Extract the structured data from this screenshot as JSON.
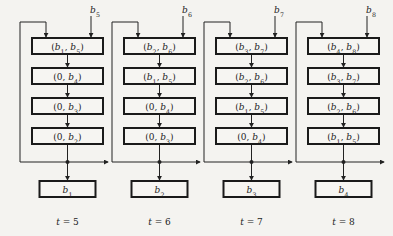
{
  "diagram": {
    "type": "shift-register pipeline over time",
    "columns": [
      {
        "time_label": "t = 5",
        "input": "b5",
        "stages": [
          "(b1, b5)",
          "(0, b4)",
          "(0, b3)",
          "(0, b2)"
        ],
        "output": "b1"
      },
      {
        "time_label": "t = 6",
        "input": "b6",
        "stages": [
          "(b2, b6)",
          "(b1, b5)",
          "(0, b4)",
          "(0, b3)"
        ],
        "output": "b2"
      },
      {
        "time_label": "t = 7",
        "input": "b7",
        "stages": [
          "(b3, b7)",
          "(b2, b6)",
          "(b1, b5)",
          "(0, b4)"
        ],
        "output": "b3"
      },
      {
        "time_label": "t = 8",
        "input": "b8",
        "stages": [
          "(b4, b8)",
          "(b3, b7)",
          "(b2, b6)",
          "(b1, b5)"
        ],
        "output": "b4"
      }
    ]
  }
}
